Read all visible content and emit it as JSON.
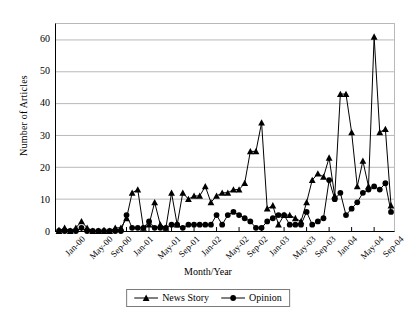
{
  "chart_data": {
    "type": "line",
    "title": "",
    "xlabel": "Month/Year",
    "ylabel": "Number of Articles",
    "ylim": [
      0,
      65
    ],
    "yticks": [
      0,
      10,
      20,
      30,
      40,
      50,
      60
    ],
    "grid": true,
    "legend_position": "bottom",
    "x": [
      "Jan-00",
      "Feb-00",
      "Mar-00",
      "Apr-00",
      "May-00",
      "Jun-00",
      "Jul-00",
      "Aug-00",
      "Sep-00",
      "Oct-00",
      "Nov-00",
      "Dec-00",
      "Jan-01",
      "Feb-01",
      "Mar-01",
      "Apr-01",
      "May-01",
      "Jun-01",
      "Jul-01",
      "Aug-01",
      "Sep-01",
      "Oct-01",
      "Nov-01",
      "Dec-01",
      "Jan-02",
      "Feb-02",
      "Mar-02",
      "Apr-02",
      "May-02",
      "Jun-02",
      "Jul-02",
      "Aug-02",
      "Sep-02",
      "Oct-02",
      "Nov-02",
      "Dec-02",
      "Jan-03",
      "Feb-03",
      "Mar-03",
      "Apr-03",
      "May-03",
      "Jun-03",
      "Jul-03",
      "Aug-03",
      "Sep-03",
      "Oct-03",
      "Nov-03",
      "Dec-03",
      "Jan-04",
      "Feb-04",
      "Mar-04",
      "Apr-04",
      "May-04",
      "Jun-04",
      "Jul-04",
      "Aug-04",
      "Sep-04",
      "Oct-04",
      "Nov-04",
      "Dec-04"
    ],
    "xtick_labels": [
      "Jan-00",
      "May-00",
      "Sep-00",
      "Jan-01",
      "May-01",
      "Sep-01",
      "Jan-02",
      "May-02",
      "Sep-02",
      "Jan-03",
      "May-03",
      "Sep-03",
      "Jan-04",
      "May-04",
      "Sep-04"
    ],
    "xtick_indices": [
      0,
      4,
      8,
      12,
      16,
      20,
      24,
      28,
      32,
      36,
      40,
      44,
      48,
      52,
      56
    ],
    "series": [
      {
        "name": "News Story",
        "marker": "triangle",
        "color": "#000000",
        "values": [
          0,
          1,
          0,
          1,
          3,
          1,
          0,
          0,
          0,
          0,
          1,
          1,
          4,
          12,
          13,
          1,
          2,
          9,
          2,
          1,
          12,
          2,
          12,
          10,
          11,
          11,
          14,
          9,
          11,
          12,
          12,
          13,
          13,
          15,
          25,
          25,
          34,
          7,
          8,
          2,
          5,
          5,
          4,
          3,
          9,
          16,
          18,
          17,
          23,
          11,
          43,
          43,
          31,
          14,
          22,
          14,
          61,
          31,
          32,
          8
        ]
      },
      {
        "name": "Opinion",
        "marker": "circle",
        "color": "#000000",
        "values": [
          0,
          0,
          0,
          0,
          1,
          0,
          0,
          0,
          0,
          0,
          0,
          0,
          5,
          1,
          1,
          1,
          3,
          1,
          1,
          1,
          2,
          2,
          1,
          2,
          2,
          2,
          2,
          2,
          5,
          2,
          5,
          6,
          5,
          4,
          3,
          1,
          1,
          3,
          4,
          5,
          5,
          2,
          2,
          2,
          6,
          2,
          3,
          4,
          16,
          10,
          12,
          5,
          7,
          9,
          12,
          13,
          14,
          13,
          15,
          6
        ]
      }
    ]
  },
  "legend": {
    "items": [
      {
        "label": "News Story",
        "marker": "triangle"
      },
      {
        "label": "Opinion",
        "marker": "circle"
      }
    ]
  }
}
